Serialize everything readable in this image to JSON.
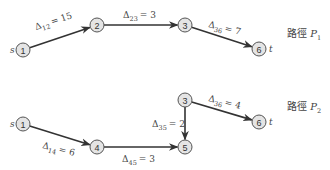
{
  "diagram": {
    "source_label": "s",
    "sink_label": "t",
    "paths": [
      {
        "name_prefix": "路徑 ",
        "name_var": "P",
        "name_sub": "1",
        "nodes": [
          {
            "id": "1",
            "x": 23,
            "y": 50,
            "tag": "s"
          },
          {
            "id": "2",
            "x": 97,
            "y": 25
          },
          {
            "id": "3",
            "x": 185,
            "y": 25
          },
          {
            "id": "6",
            "x": 259,
            "y": 49,
            "tag": "t"
          }
        ],
        "edges": [
          {
            "from": "1",
            "to": "2",
            "delta_sub": "12",
            "value": "= 15",
            "lx": 36,
            "ly": 30,
            "rot": -18
          },
          {
            "from": "2",
            "to": "3",
            "delta_sub": "23",
            "value": "= 3",
            "lx": 123,
            "ly": 18,
            "rot": 0
          },
          {
            "from": "3",
            "to": "6",
            "delta_sub": "36",
            "value": "= 7",
            "lx": 208,
            "ly": 27,
            "rot": 14
          }
        ]
      },
      {
        "name_prefix": "路徑 ",
        "name_var": "P",
        "name_sub": "2",
        "nodes": [
          {
            "id": "1",
            "x": 23,
            "y": 124,
            "tag": "s"
          },
          {
            "id": "4",
            "x": 97,
            "y": 147
          },
          {
            "id": "5",
            "x": 185,
            "y": 147
          },
          {
            "id": "3",
            "x": 185,
            "y": 100
          },
          {
            "id": "6",
            "x": 259,
            "y": 122,
            "tag": "t"
          }
        ],
        "edges": [
          {
            "from": "1",
            "to": "4",
            "delta_sub": "14",
            "value": "= 6",
            "lx": 42,
            "ly": 148,
            "rot": 14
          },
          {
            "from": "4",
            "to": "5",
            "delta_sub": "45",
            "value": "= 3",
            "lx": 122,
            "ly": 162,
            "rot": 0
          },
          {
            "from": "3",
            "to": "5",
            "delta_sub": "35",
            "value": "= 2",
            "lx": 152,
            "ly": 127,
            "rot": 0
          },
          {
            "from": "3",
            "to": "6",
            "delta_sub": "36",
            "value": "= 4",
            "lx": 208,
            "ly": 101,
            "rot": 14
          }
        ]
      }
    ],
    "path_label_positions": [
      {
        "x": 287,
        "y": 37
      },
      {
        "x": 287,
        "y": 110
      }
    ]
  }
}
